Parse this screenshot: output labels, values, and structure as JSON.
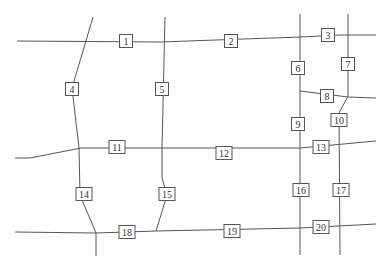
{
  "diagram": {
    "type": "road-network",
    "line_color": "#555555",
    "roads": [
      {
        "id": "h-top",
        "points": [
          [
            17,
            41
          ],
          [
            160,
            42
          ],
          [
            300,
            37
          ],
          [
            340,
            35
          ],
          [
            376,
            35
          ]
        ]
      },
      {
        "id": "h-mid-right",
        "points": [
          [
            300,
            91
          ],
          [
            348,
            97
          ],
          [
            376,
            98
          ]
        ]
      },
      {
        "id": "h-middle",
        "points": [
          [
            15,
            158
          ],
          [
            30,
            158
          ],
          [
            81,
            148
          ],
          [
            162,
            148
          ],
          [
            300,
            148
          ],
          [
            376,
            141
          ]
        ]
      },
      {
        "id": "h-bottom",
        "points": [
          [
            15,
            232
          ],
          [
            96,
            233
          ],
          [
            156,
            231
          ],
          [
            300,
            228
          ],
          [
            376,
            224
          ]
        ]
      },
      {
        "id": "v-left",
        "points": [
          [
            93,
            17
          ],
          [
            72,
            88
          ],
          [
            79,
            148
          ],
          [
            80,
            195
          ],
          [
            96,
            233
          ],
          [
            96,
            256
          ]
        ]
      },
      {
        "id": "v-center",
        "points": [
          [
            165,
            17
          ],
          [
            162,
            148
          ],
          [
            162,
            178
          ],
          [
            167,
            195
          ],
          [
            156,
            231
          ]
        ]
      },
      {
        "id": "v-right1",
        "points": [
          [
            300,
            14
          ],
          [
            300,
            255
          ]
        ]
      },
      {
        "id": "v-right2",
        "points": [
          [
            348,
            14
          ],
          [
            348,
            96
          ],
          [
            339,
            113
          ],
          [
            340,
            255
          ]
        ]
      }
    ],
    "labels": [
      {
        "id": 1,
        "text": "1",
        "x": 126,
        "y": 41
      },
      {
        "id": 2,
        "text": "2",
        "x": 231,
        "y": 41
      },
      {
        "id": 3,
        "text": "3",
        "x": 328,
        "y": 35
      },
      {
        "id": 4,
        "text": "4",
        "x": 72,
        "y": 89
      },
      {
        "id": 5,
        "text": "5",
        "x": 162,
        "y": 89
      },
      {
        "id": 6,
        "text": "6",
        "x": 298,
        "y": 68
      },
      {
        "id": 7,
        "text": "7",
        "x": 348,
        "y": 64
      },
      {
        "id": 8,
        "text": "8",
        "x": 327,
        "y": 96
      },
      {
        "id": 9,
        "text": "9",
        "x": 298,
        "y": 124
      },
      {
        "id": 10,
        "text": "10",
        "x": 339,
        "y": 120
      },
      {
        "id": 11,
        "text": "11",
        "x": 117,
        "y": 147
      },
      {
        "id": 12,
        "text": "12",
        "x": 224,
        "y": 153
      },
      {
        "id": 13,
        "text": "13",
        "x": 321,
        "y": 147
      },
      {
        "id": 14,
        "text": "14",
        "x": 84,
        "y": 194
      },
      {
        "id": 15,
        "text": "15",
        "x": 167,
        "y": 194
      },
      {
        "id": 16,
        "text": "16",
        "x": 301,
        "y": 190
      },
      {
        "id": 17,
        "text": "17",
        "x": 341,
        "y": 190
      },
      {
        "id": 18,
        "text": "18",
        "x": 127,
        "y": 232
      },
      {
        "id": 19,
        "text": "19",
        "x": 232,
        "y": 231
      },
      {
        "id": 20,
        "text": "20",
        "x": 321,
        "y": 227
      }
    ]
  }
}
